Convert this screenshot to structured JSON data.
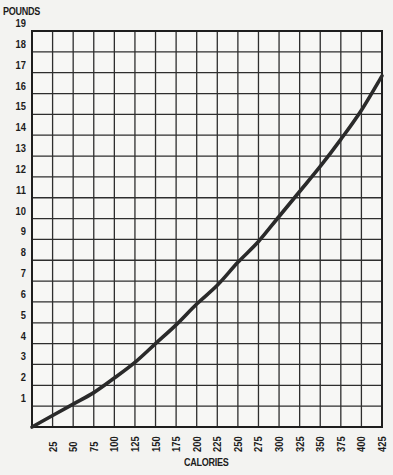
{
  "chart_data": {
    "type": "line",
    "title": "",
    "xlabel": "CALORIES",
    "ylabel": "POUNDS",
    "x_ticks": [
      25,
      50,
      75,
      100,
      125,
      150,
      175,
      200,
      225,
      250,
      275,
      300,
      325,
      350,
      375,
      400,
      425
    ],
    "y_ticks": [
      1,
      2,
      3,
      4,
      5,
      6,
      7,
      8,
      9,
      10,
      11,
      12,
      13,
      14,
      15,
      16,
      17,
      18,
      19
    ],
    "xlim": [
      0,
      425
    ],
    "ylim": [
      0,
      19
    ],
    "grid": true,
    "legend": null,
    "series": [
      {
        "name": "Pounds vs Calories",
        "x": [
          0,
          25,
          50,
          75,
          100,
          125,
          150,
          175,
          200,
          225,
          250,
          275,
          300,
          325,
          350,
          375,
          400,
          425
        ],
        "values": [
          0,
          0.55,
          1.1,
          1.65,
          2.35,
          3.1,
          4.0,
          4.9,
          5.9,
          6.8,
          7.9,
          8.9,
          10.1,
          11.3,
          12.5,
          13.8,
          15.2,
          16.85
        ]
      }
    ],
    "colors": {
      "line": "#2a2a2a",
      "grid": "#2e2e2e",
      "background": "#f3f3f1"
    }
  }
}
